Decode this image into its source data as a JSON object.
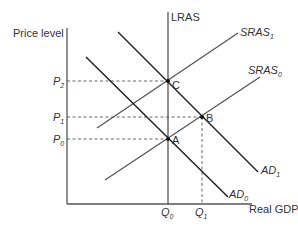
{
  "diagram": {
    "type": "AD-AS model",
    "axes": {
      "y_label": "Price level",
      "x_label": "Real GDP"
    },
    "curves": {
      "lras": {
        "label": "LRAS"
      },
      "sras0": {
        "label": "SRAS",
        "sub": "0"
      },
      "sras1": {
        "label": "SRAS",
        "sub": "1"
      },
      "ad0": {
        "label": "AD",
        "sub": "0"
      },
      "ad1": {
        "label": "AD",
        "sub": "1"
      }
    },
    "points": {
      "a": "A",
      "b": "B",
      "c": "C"
    },
    "price_levels": {
      "p0": {
        "label": "P",
        "sub": "0"
      },
      "p1": {
        "label": "P",
        "sub": "1"
      },
      "p2": {
        "label": "P",
        "sub": "2"
      }
    },
    "quantities": {
      "q0": {
        "label": "Q",
        "sub": "0"
      },
      "q1": {
        "label": "Q",
        "sub": "1"
      }
    },
    "colors": {
      "axis": "#555555",
      "ad": "#222222",
      "sras": "#555555",
      "text": "#333333"
    }
  }
}
